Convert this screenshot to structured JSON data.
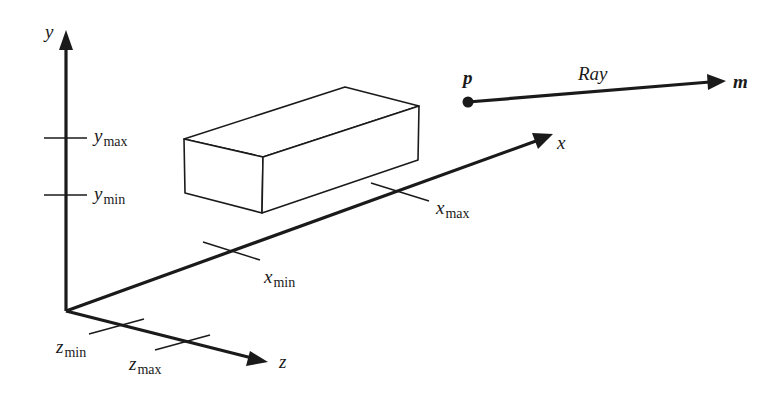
{
  "diagram": {
    "axes": {
      "y": {
        "label": "y"
      },
      "x": {
        "label": "x"
      },
      "z": {
        "label": "z"
      }
    },
    "ticks": {
      "y_max": {
        "base": "y",
        "sub": "max"
      },
      "y_min": {
        "base": "y",
        "sub": "min"
      },
      "x_min": {
        "base": "x",
        "sub": "min"
      },
      "x_max": {
        "base": "x",
        "sub": "max"
      },
      "z_min": {
        "base": "z",
        "sub": "min"
      },
      "z_max": {
        "base": "z",
        "sub": "max"
      }
    },
    "ray": {
      "label": "Ray",
      "start_point": "p",
      "end_point": "m"
    },
    "colors": {
      "stroke": "#1a1a1a",
      "background": "#ffffff"
    }
  }
}
